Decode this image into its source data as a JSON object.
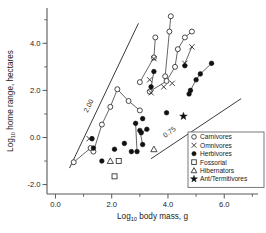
{
  "chart_data": {
    "type": "scatter",
    "title": "",
    "xlabel": "Log10 body mass, g",
    "ylabel": "Log10 home range, hectares",
    "xlabel_parts": {
      "base": "Log",
      "sub": "10",
      "rest": " body mass, g"
    },
    "ylabel_parts": {
      "base": "Log",
      "sub": "10",
      "rest": " home range, hectares"
    },
    "xlim": [
      -0.3,
      7.2
    ],
    "ylim": [
      -2.4,
      5.5
    ],
    "xticks": [
      0.0,
      2.0,
      4.0,
      6.0
    ],
    "xticklabels": [
      "0.0",
      "2.0",
      "4.0",
      "6.0"
    ],
    "xticks_minor": [
      1.0,
      3.0,
      5.0,
      7.0
    ],
    "yticks": [
      -2.0,
      0.0,
      2.0,
      4.0
    ],
    "yticklabels": [
      "-2.0",
      "0.0",
      "2.0",
      "4.0"
    ],
    "yticks_minor": [
      -1.0,
      1.0,
      3.0,
      5.0
    ],
    "grid": false,
    "legend_position": "bottom-right",
    "reference_lines": [
      {
        "label": "2.00",
        "slope": 2.0,
        "x1": 0.5,
        "y1": -1.3,
        "x2": 2.95,
        "y2": 4.85,
        "label_x": 1.25,
        "label_y": 1.3,
        "label_angle": -62
      },
      {
        "label": "0.75",
        "slope": 0.75,
        "x1": 3.4,
        "y1": -0.9,
        "x2": 6.6,
        "y2": 1.65,
        "label_x": 4.1,
        "label_y": 0.15,
        "label_angle": -37
      }
    ],
    "series": [
      {
        "name": "Carnivores",
        "marker": "open-circle",
        "points": [
          {
            "x": 0.65,
            "y": -1.05
          },
          {
            "x": 1.25,
            "y": -0.45
          },
          {
            "x": 1.35,
            "y": -0.6
          },
          {
            "x": 1.65,
            "y": 0.55
          },
          {
            "x": 1.95,
            "y": 1.3
          },
          {
            "x": 2.2,
            "y": 2.05
          },
          {
            "x": 2.6,
            "y": 1.55
          },
          {
            "x": 3.0,
            "y": 1.15
          },
          {
            "x": 3.0,
            "y": 2.35
          },
          {
            "x": 3.35,
            "y": 1.95
          },
          {
            "x": 3.5,
            "y": 3.4
          },
          {
            "x": 3.55,
            "y": 4.25
          },
          {
            "x": 3.9,
            "y": 2.6
          },
          {
            "x": 3.95,
            "y": 2.4
          },
          {
            "x": 4.05,
            "y": 4.5
          },
          {
            "x": 4.1,
            "y": 5.15
          },
          {
            "x": 4.25,
            "y": 3.0
          },
          {
            "x": 4.35,
            "y": 3.75
          },
          {
            "x": 4.6,
            "y": 4.25
          },
          {
            "x": 4.85,
            "y": 4.5
          }
        ],
        "connections": [
          [
            0,
            1
          ],
          [
            2,
            3
          ],
          [
            3,
            4
          ],
          [
            4,
            5
          ],
          [
            5,
            6
          ],
          [
            6,
            7
          ],
          [
            8,
            10
          ],
          [
            10,
            11
          ],
          [
            9,
            13
          ],
          [
            13,
            16
          ],
          [
            16,
            17
          ],
          [
            17,
            18
          ],
          [
            18,
            19
          ],
          [
            12,
            14
          ],
          [
            14,
            15
          ]
        ]
      },
      {
        "name": "Omnivores",
        "marker": "x",
        "points": [
          {
            "x": 1.2,
            "y": -0.05
          },
          {
            "x": 3.35,
            "y": 2.45
          },
          {
            "x": 3.4,
            "y": 1.9
          },
          {
            "x": 3.5,
            "y": 3.35
          },
          {
            "x": 3.85,
            "y": 2.15
          },
          {
            "x": 4.15,
            "y": 2.3
          },
          {
            "x": 4.6,
            "y": 3.15
          },
          {
            "x": 4.85,
            "y": 3.85
          }
        ],
        "connections": [
          [
            6,
            7
          ]
        ]
      },
      {
        "name": "Herbivores",
        "marker": "filled-circle",
        "points": [
          {
            "x": 1.3,
            "y": -0.05
          },
          {
            "x": 1.35,
            "y": -0.45
          },
          {
            "x": 1.65,
            "y": -1.0
          },
          {
            "x": 2.1,
            "y": -0.5
          },
          {
            "x": 2.45,
            "y": -0.25
          },
          {
            "x": 2.7,
            "y": -0.6
          },
          {
            "x": 2.85,
            "y": 0.6
          },
          {
            "x": 2.9,
            "y": -0.6
          },
          {
            "x": 3.0,
            "y": 0.3
          },
          {
            "x": 3.05,
            "y": 0.2
          },
          {
            "x": 3.1,
            "y": 0.8
          },
          {
            "x": 3.1,
            "y": -0.3
          },
          {
            "x": 3.25,
            "y": 0.35
          },
          {
            "x": 3.4,
            "y": 2.15
          },
          {
            "x": 3.5,
            "y": 2.8
          },
          {
            "x": 3.95,
            "y": 1.05
          },
          {
            "x": 4.6,
            "y": 3.05
          },
          {
            "x": 4.75,
            "y": 1.85
          },
          {
            "x": 4.8,
            "y": 2.0
          },
          {
            "x": 5.0,
            "y": 2.45
          },
          {
            "x": 5.15,
            "y": 2.7
          },
          {
            "x": 5.55,
            "y": 3.15
          }
        ],
        "connections": [
          [
            6,
            7
          ],
          [
            8,
            11
          ],
          [
            9,
            12
          ],
          [
            13,
            14
          ],
          [
            17,
            18
          ],
          [
            18,
            19
          ],
          [
            19,
            20
          ],
          [
            20,
            21
          ]
        ]
      },
      {
        "name": "Fossorial",
        "marker": "square",
        "points": [
          {
            "x": 2.25,
            "y": -1.0
          },
          {
            "x": 2.1,
            "y": -1.65
          }
        ],
        "connections": []
      },
      {
        "name": "Hibernators",
        "marker": "triangle",
        "points": [
          {
            "x": 1.95,
            "y": -1.0
          },
          {
            "x": 3.5,
            "y": -0.5
          }
        ],
        "connections": []
      },
      {
        "name": "Ant/Termitivores",
        "marker": "star",
        "points": [
          {
            "x": 4.55,
            "y": 0.9
          }
        ],
        "connections": []
      }
    ],
    "legend": [
      {
        "label": "Carnivores",
        "marker": "open-circle"
      },
      {
        "label": "Omnivores",
        "marker": "x"
      },
      {
        "label": "Herbivores",
        "marker": "filled-circle"
      },
      {
        "label": "Fossorial",
        "marker": "square"
      },
      {
        "label": "Hibernators",
        "marker": "triangle"
      },
      {
        "label": "Ant/Termitivores",
        "marker": "star"
      }
    ]
  }
}
